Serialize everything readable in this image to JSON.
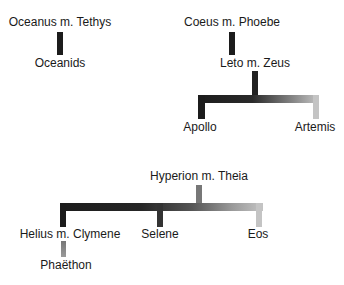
{
  "colors": {
    "dark": "#1c1c1c",
    "mid": "#6e6e6e",
    "light": "#bdbdbd",
    "text": "#1a1a1a"
  },
  "families": [
    {
      "parents": "Oceanus m. Tethys",
      "children": [
        "Oceanids"
      ]
    },
    {
      "parents": "Coeus m. Phoebe",
      "children": [
        "Leto m. Zeus"
      ],
      "grandchildren": [
        "Apollo",
        "Artemis"
      ]
    },
    {
      "parents": "Hyperion m. Theia",
      "children": [
        "Helius m. Clymene",
        "Selene",
        "Eos"
      ],
      "grandchildren": [
        "Phaëthon"
      ]
    }
  ]
}
